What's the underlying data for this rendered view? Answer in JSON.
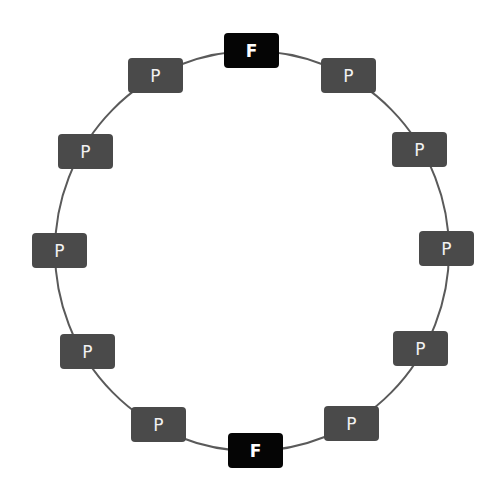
{
  "diagram": {
    "type": "ring",
    "center": [
      252,
      251
    ],
    "radius": 200,
    "colors": {
      "P": "#4a4a4a",
      "F": "#050505",
      "line": "#5a5a5a",
      "text": "#f2f2f2"
    },
    "nodes": [
      {
        "label": "F",
        "kind": "f",
        "x": 224,
        "y": 33
      },
      {
        "label": "P",
        "kind": "p",
        "x": 321,
        "y": 58
      },
      {
        "label": "P",
        "kind": "p",
        "x": 392,
        "y": 132
      },
      {
        "label": "P",
        "kind": "p",
        "x": 419,
        "y": 231
      },
      {
        "label": "P",
        "kind": "p",
        "x": 393,
        "y": 331
      },
      {
        "label": "P",
        "kind": "p",
        "x": 324,
        "y": 406
      },
      {
        "label": "F",
        "kind": "f",
        "x": 228,
        "y": 433
      },
      {
        "label": "P",
        "kind": "p",
        "x": 131,
        "y": 407
      },
      {
        "label": "P",
        "kind": "p",
        "x": 60,
        "y": 334
      },
      {
        "label": "P",
        "kind": "p",
        "x": 32,
        "y": 233
      },
      {
        "label": "P",
        "kind": "p",
        "x": 58,
        "y": 134
      },
      {
        "label": "P",
        "kind": "p",
        "x": 128,
        "y": 58
      }
    ]
  }
}
